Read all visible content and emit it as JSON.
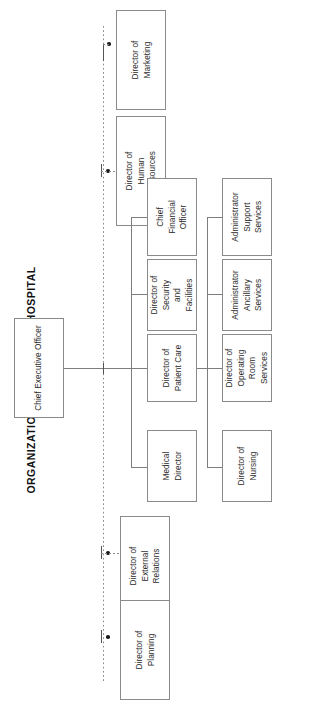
{
  "title": "ORGANIZATION OF A MODERN HOSPITAL",
  "chart_data": {
    "type": "diagram",
    "diagram_type": "organization-chart",
    "title": "ORGANIZATION OF A MODERN HOSPITAL",
    "orientation": "rotated-90-counterclockwise",
    "root": "Chief Executive Officer",
    "nodes": [
      "Chief Executive Officer",
      "Director of Marketing",
      "Director of Human Resources",
      "Director of External Relations",
      "Director of Planning",
      "Chief Financial Officer",
      "Director of Security and Facilities",
      "Director of Patient Care",
      "Medical Director",
      "Administrator Support Services",
      "Administrator Ancillary Services",
      "Director of Operating Room Services",
      "Director of Nursing"
    ],
    "edges": [
      {
        "from": "Chief Executive Officer",
        "to": "Director of Marketing",
        "style": "dotted"
      },
      {
        "from": "Chief Executive Officer",
        "to": "Director of Human Resources",
        "style": "dotted"
      },
      {
        "from": "Chief Executive Officer",
        "to": "Director of External Relations",
        "style": "dotted"
      },
      {
        "from": "Chief Executive Officer",
        "to": "Director of Planning",
        "style": "dotted"
      },
      {
        "from": "Chief Executive Officer",
        "to": "Chief Financial Officer",
        "style": "solid"
      },
      {
        "from": "Chief Executive Officer",
        "to": "Director of Security and Facilities",
        "style": "solid"
      },
      {
        "from": "Chief Executive Officer",
        "to": "Director of Patient Care",
        "style": "solid"
      },
      {
        "from": "Chief Executive Officer",
        "to": "Medical Director",
        "style": "solid"
      },
      {
        "from": "Director of Patient Care",
        "to": "Administrator Support Services",
        "style": "solid"
      },
      {
        "from": "Director of Patient Care",
        "to": "Administrator Ancillary Services",
        "style": "solid"
      },
      {
        "from": "Director of Patient Care",
        "to": "Director of Operating Room Services",
        "style": "solid"
      },
      {
        "from": "Director of Patient Care",
        "to": "Director of Nursing",
        "style": "solid"
      }
    ],
    "colors": {
      "background": "#ffffff",
      "box_border": "#8a8a8a",
      "line": "#7d7d7d",
      "text": "#2b2b2b",
      "title_text": "#111111"
    }
  },
  "executive": {
    "ceo": "Chief Executive Officer"
  },
  "staff": [
    {
      "label": "Director of\nMarketing"
    },
    {
      "label": "Director of\nHuman\nResources"
    },
    {
      "label": "Director of\nExternal\nRelations"
    },
    {
      "label": "Director of\nPlanning"
    }
  ],
  "line_directors": [
    {
      "label": "Chief\nFinancial\nOfficer"
    },
    {
      "label": "Director of\nSecurity\nand\nFacilities"
    },
    {
      "label": "Director of\nPatient Care"
    },
    {
      "label": "Medical\nDirector"
    }
  ],
  "patient_care_reports": [
    {
      "label": "Administrator\nSupport\nServices"
    },
    {
      "label": "Administrator\nAncillary\nServices"
    },
    {
      "label": "Director of\nOperating\nRoom\nServices"
    },
    {
      "label": "Director of\nNursing"
    }
  ]
}
